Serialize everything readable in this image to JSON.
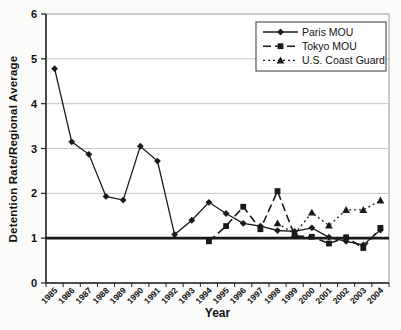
{
  "chart_data": {
    "type": "line",
    "title": "",
    "xlabel": "Year",
    "ylabel": "Detention Rate/Regional Average",
    "ylim": [
      0,
      6
    ],
    "yticks": [
      0,
      1,
      2,
      3,
      4,
      5,
      6
    ],
    "grid": "horizontal-light",
    "reference_line_y": 1,
    "legend_position": "top-right-inside",
    "colors": {
      "line": "#1a1a1a",
      "gridline": "#c6c6c6",
      "reference_line": "#1a1a1a",
      "plot_border": "#999999",
      "text": "#111111"
    },
    "categories": [
      "1985",
      "1986",
      "1987",
      "1988",
      "1989",
      "1990",
      "1991",
      "1992",
      "1993",
      "1994",
      "1995",
      "1996",
      "1997",
      "1998",
      "1999",
      "2000",
      "2001",
      "2002",
      "2003",
      "2004"
    ],
    "series": [
      {
        "name": "Paris MOU",
        "marker": "diamond",
        "line": "solid",
        "color": "#1a1a1a",
        "values": [
          4.78,
          3.15,
          2.87,
          1.93,
          1.85,
          3.05,
          2.72,
          1.08,
          1.4,
          1.8,
          1.55,
          1.33,
          1.27,
          1.17,
          1.15,
          1.23,
          1.02,
          0.93,
          0.85,
          1.18
        ]
      },
      {
        "name": "Tokyo MOU",
        "marker": "square",
        "line": "dashed",
        "color": "#1a1a1a",
        "values": [
          null,
          null,
          null,
          null,
          null,
          null,
          null,
          null,
          null,
          0.93,
          1.27,
          1.7,
          1.2,
          2.05,
          1.05,
          1.03,
          0.88,
          1.02,
          0.78,
          1.23
        ]
      },
      {
        "name": "U.S. Coast Guard",
        "marker": "triangle",
        "line": "dotted",
        "color": "#1a1a1a",
        "values": [
          null,
          null,
          null,
          null,
          null,
          null,
          null,
          null,
          null,
          null,
          null,
          null,
          null,
          1.33,
          1.1,
          1.57,
          1.28,
          1.63,
          1.63,
          1.84
        ]
      }
    ]
  }
}
